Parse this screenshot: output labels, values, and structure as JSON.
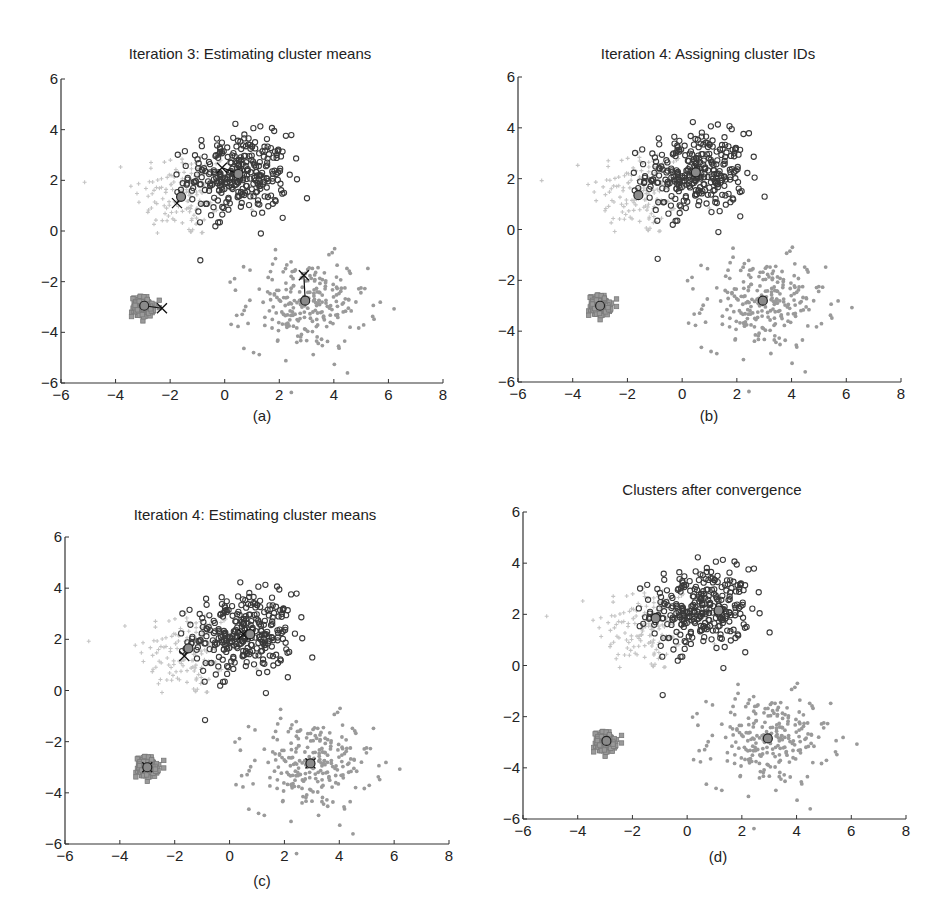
{
  "figure": {
    "panels": [
      {
        "id": "a",
        "title": "Iteration 3: Estimating cluster means",
        "label": "(a)"
      },
      {
        "id": "b",
        "title": "Iteration 4: Assigning cluster IDs",
        "label": "(b)"
      },
      {
        "id": "c",
        "title": "Iteration 4: Estimating cluster means",
        "label": "(c)"
      },
      {
        "id": "d",
        "title": "Clusters after convergence",
        "label": "(d)"
      }
    ],
    "colors": {
      "cluster_light_plus": "#c4c4c4",
      "cluster_dark_circle": "#3a3a3a",
      "cluster_square": "#7a7a7a",
      "cluster_gray_star": "#9a9a9a",
      "centroid_fill": "#8a8a8a",
      "axis": "#333333"
    }
  },
  "chart_data": [
    {
      "type": "scatter",
      "title": "Iteration 3: Estimating cluster means",
      "subtitle": "(a)",
      "xlabel": "",
      "ylabel": "",
      "xlim": [
        -6,
        8
      ],
      "ylim": [
        -6,
        6
      ],
      "xticks": [
        -6,
        -4,
        -2,
        0,
        2,
        4,
        6,
        8
      ],
      "yticks": [
        -6,
        -4,
        -2,
        0,
        2,
        4,
        6
      ],
      "grid": false,
      "series": [
        {
          "name": "light-plus cluster",
          "marker": "+",
          "center": [
            -1.5,
            1.5
          ],
          "spread": [
            0.9,
            0.9
          ],
          "n": 150
        },
        {
          "name": "dark-circle cluster",
          "marker": "o",
          "center": [
            0.5,
            2.2
          ],
          "spread": [
            0.9,
            0.8
          ],
          "n": 300
        },
        {
          "name": "square cluster",
          "marker": "s",
          "center": [
            -3.0,
            -3.0
          ],
          "spread": [
            0.2,
            0.2
          ],
          "n": 150
        },
        {
          "name": "gray-star cluster",
          "marker": "*",
          "center": [
            3.0,
            -2.9
          ],
          "spread": [
            1.1,
            0.9
          ],
          "n": 250
        }
      ],
      "centroids_old": [
        [
          -1.6,
          1.35
        ],
        [
          0.5,
          2.25
        ],
        [
          -2.95,
          -2.95
        ],
        [
          2.95,
          -2.75
        ]
      ],
      "centroids_new": [
        [
          -1.75,
          1.1
        ],
        [
          -0.1,
          2.5
        ],
        [
          -2.3,
          -3.05
        ],
        [
          2.9,
          -1.75
        ]
      ]
    },
    {
      "type": "scatter",
      "title": "Iteration 4: Assigning cluster IDs",
      "subtitle": "(b)",
      "xlabel": "",
      "ylabel": "",
      "xlim": [
        -6,
        8
      ],
      "ylim": [
        -6,
        6
      ],
      "xticks": [
        -6,
        -4,
        -2,
        0,
        2,
        4,
        6,
        8
      ],
      "yticks": [
        -6,
        -4,
        -2,
        0,
        2,
        4,
        6
      ],
      "grid": false,
      "centroids": [
        [
          -1.6,
          1.35
        ],
        [
          0.5,
          2.25
        ],
        [
          -3.0,
          -3.0
        ],
        [
          2.95,
          -2.8
        ]
      ]
    },
    {
      "type": "scatter",
      "title": "Iteration 4: Estimating cluster means",
      "subtitle": "(c)",
      "xlabel": "",
      "ylabel": "",
      "xlim": [
        -6,
        8
      ],
      "ylim": [
        -6,
        6
      ],
      "xticks": [
        -6,
        -4,
        -2,
        0,
        2,
        4,
        6,
        8
      ],
      "yticks": [
        -6,
        -4,
        -2,
        0,
        2,
        4,
        6
      ],
      "grid": false,
      "centroids_old": [
        [
          -1.5,
          1.65
        ],
        [
          0.75,
          2.2
        ],
        [
          -3.0,
          -3.0
        ],
        [
          2.95,
          -2.85
        ]
      ],
      "centroids_new": [
        [
          -1.65,
          1.35
        ],
        [
          0.5,
          2.2
        ],
        [
          -3.0,
          -3.0
        ],
        [
          2.95,
          -2.85
        ]
      ]
    },
    {
      "type": "scatter",
      "title": "Clusters after convergence",
      "subtitle": "(d)",
      "xlabel": "",
      "ylabel": "",
      "xlim": [
        -6,
        8
      ],
      "ylim": [
        -6,
        6
      ],
      "xticks": [
        -6,
        -4,
        -2,
        0,
        2,
        4,
        6,
        8
      ],
      "yticks": [
        -6,
        -4,
        -2,
        0,
        2,
        4,
        6
      ],
      "grid": false,
      "centroids": [
        [
          -1.15,
          1.85
        ],
        [
          1.15,
          2.15
        ],
        [
          -2.95,
          -2.95
        ],
        [
          2.95,
          -2.85
        ]
      ]
    }
  ]
}
